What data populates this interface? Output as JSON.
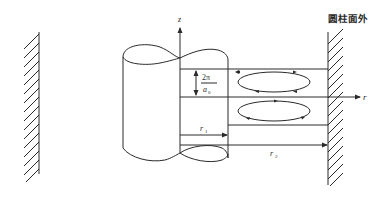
{
  "diagram": {
    "title_label": "圆柱面外",
    "axes": {
      "z_label": "z",
      "r_label": "r"
    },
    "dimensions": {
      "wavelength_numerator": "2π",
      "wavelength_denominator": "a",
      "wavelength_denominator_sub": "0",
      "inner_radius_label": "r",
      "inner_radius_sub": "1",
      "outer_radius_label": "r",
      "outer_radius_sub": "2"
    },
    "elements": [
      "left-wall-hatched",
      "inner-cylinder",
      "right-wall-hatched",
      "upper-vortex-cell",
      "lower-vortex-cell"
    ],
    "colors": {
      "stroke": "#2a2a2a",
      "background": "#ffffff"
    }
  }
}
